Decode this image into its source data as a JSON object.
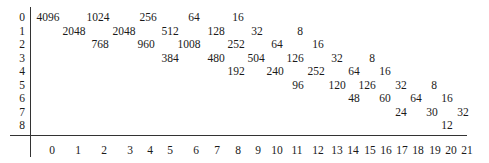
{
  "table": {
    "row_labels": [
      "0",
      "1",
      "2",
      "3",
      "4",
      "5",
      "6",
      "7",
      "8"
    ],
    "column_labels": [
      "0",
      "1",
      "2",
      "3",
      "4",
      "5",
      "6",
      "7",
      "8",
      "9",
      "10",
      "11",
      "12",
      "13",
      "14",
      "15",
      "16",
      "17",
      "18",
      "19",
      "20",
      "21"
    ],
    "rows": [
      {
        "row": 0,
        "cells": [
          {
            "col": 0,
            "x": 48,
            "value": "4096"
          },
          {
            "col": 2,
            "x": 98,
            "value": "1024"
          },
          {
            "col": 4,
            "x": 148,
            "value": "256"
          },
          {
            "col": 6,
            "x": 194,
            "value": "64"
          },
          {
            "col": 8,
            "x": 238,
            "value": "16"
          }
        ]
      },
      {
        "row": 1,
        "cells": [
          {
            "col": 1,
            "x": 74,
            "value": "2048"
          },
          {
            "col": 3,
            "x": 124,
            "value": "2048"
          },
          {
            "col": 5,
            "x": 170,
            "value": "512"
          },
          {
            "col": 7,
            "x": 216,
            "value": "128"
          },
          {
            "col": 9,
            "x": 257,
            "value": "32"
          },
          {
            "col": 11,
            "x": 300,
            "value": "8"
          }
        ]
      },
      {
        "row": 2,
        "cells": [
          {
            "col": 2,
            "x": 100,
            "value": "768"
          },
          {
            "col": 4,
            "x": 146,
            "value": "960"
          },
          {
            "col": 6,
            "x": 189,
            "value": "1008"
          },
          {
            "col": 8,
            "x": 236,
            "value": "252"
          },
          {
            "col": 10,
            "x": 277,
            "value": "64"
          },
          {
            "col": 12,
            "x": 318,
            "value": "16"
          }
        ]
      },
      {
        "row": 3,
        "cells": [
          {
            "col": 5,
            "x": 170,
            "value": "384"
          },
          {
            "col": 7,
            "x": 216,
            "value": "480"
          },
          {
            "col": 9,
            "x": 256,
            "value": "504"
          },
          {
            "col": 11,
            "x": 295,
            "value": "126"
          },
          {
            "col": 13,
            "x": 337,
            "value": "32"
          },
          {
            "col": 15,
            "x": 372,
            "value": "8"
          }
        ]
      },
      {
        "row": 4,
        "cells": [
          {
            "col": 8,
            "x": 236,
            "value": "192"
          },
          {
            "col": 10,
            "x": 275,
            "value": "240"
          },
          {
            "col": 12,
            "x": 316,
            "value": "252"
          },
          {
            "col": 14,
            "x": 354,
            "value": "64"
          },
          {
            "col": 16,
            "x": 385,
            "value": "16"
          }
        ]
      },
      {
        "row": 5,
        "cells": [
          {
            "col": 11,
            "x": 298,
            "value": "96"
          },
          {
            "col": 13,
            "x": 337,
            "value": "120"
          },
          {
            "col": 15,
            "x": 367,
            "value": "126"
          },
          {
            "col": 17,
            "x": 401,
            "value": "32"
          },
          {
            "col": 19,
            "x": 434,
            "value": "8"
          }
        ]
      },
      {
        "row": 6,
        "cells": [
          {
            "col": 14,
            "x": 354,
            "value": "48"
          },
          {
            "col": 16,
            "x": 385,
            "value": "60"
          },
          {
            "col": 18,
            "x": 416,
            "value": "64"
          },
          {
            "col": 20,
            "x": 447,
            "value": "16"
          }
        ]
      },
      {
        "row": 7,
        "cells": [
          {
            "col": 17,
            "x": 401,
            "value": "24"
          },
          {
            "col": 19,
            "x": 432,
            "value": "30"
          },
          {
            "col": 21,
            "x": 463,
            "value": "32"
          }
        ]
      },
      {
        "row": 8,
        "cells": [
          {
            "col": 20,
            "x": 447,
            "value": "12"
          }
        ]
      }
    ]
  },
  "layout": {
    "row_y": [
      11,
      25,
      38,
      52,
      65,
      79,
      92,
      106,
      119
    ],
    "col_x": [
      52,
      78,
      104,
      130,
      150,
      170,
      196,
      217,
      238,
      258,
      277,
      297,
      318,
      337,
      353,
      370,
      386,
      402,
      418,
      435,
      451,
      467
    ]
  }
}
